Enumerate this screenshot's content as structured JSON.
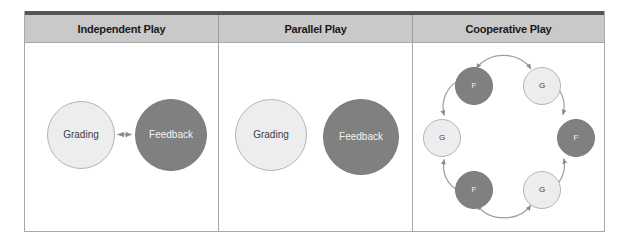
{
  "diagram": {
    "columns": [
      {
        "header": "Independent Play"
      },
      {
        "header": "Parallel Play"
      },
      {
        "header": "Cooperative Play"
      }
    ],
    "colors": {
      "header_bg": "#c9c9c9",
      "header_top_strip": "#555555",
      "grid_line": "#a8a8a8",
      "light_node_fill": "#ededed",
      "light_node_text": "#3d3d3d",
      "dark_node_fill": "#808080",
      "dark_node_text": "#f2f2f2",
      "arrow": "#8c8c8c"
    },
    "independent_play": {
      "nodes": [
        {
          "label": "Grading",
          "style": "light"
        },
        {
          "label": "Feedback",
          "style": "dark"
        }
      ],
      "connector": "double-headed-straight-arrow"
    },
    "parallel_play": {
      "nodes": [
        {
          "label": "Grading",
          "style": "light"
        },
        {
          "label": "Feedback",
          "style": "dark"
        }
      ],
      "connector": "none"
    },
    "cooperative_play": {
      "nodes": [
        {
          "label": "F",
          "style": "dark",
          "position": "top-left"
        },
        {
          "label": "G",
          "style": "light",
          "position": "top-right"
        },
        {
          "label": "F",
          "style": "dark",
          "position": "right"
        },
        {
          "label": "G",
          "style": "light",
          "position": "bottom-right"
        },
        {
          "label": "F",
          "style": "dark",
          "position": "bottom-left"
        },
        {
          "label": "G",
          "style": "light",
          "position": "left"
        }
      ],
      "connector": "curved-double-headed-arrows-ring"
    }
  }
}
